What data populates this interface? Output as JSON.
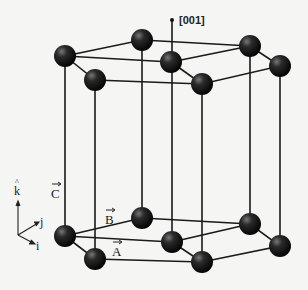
{
  "diagram": {
    "direction_label": "[001]",
    "lattice_vectors": {
      "a": "A",
      "b": "B",
      "c": "C"
    },
    "axes": {
      "k": "k",
      "j": "j",
      "i": "i"
    },
    "colors": {
      "atom": "#111111",
      "line": "#1a1a1a",
      "background": "#f5f5f4"
    }
  }
}
